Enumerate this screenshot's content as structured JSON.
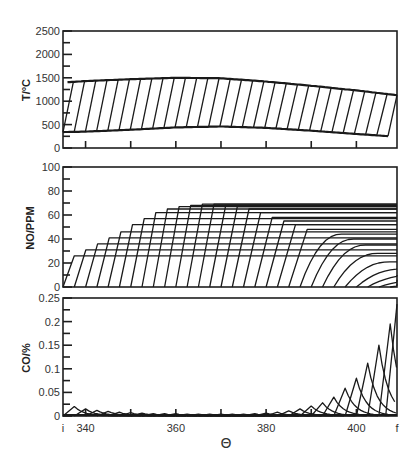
{
  "chart_data": [
    {
      "type": "area",
      "panel": "top",
      "ylabel": "T/°C",
      "ylim": [
        0,
        2500
      ],
      "yticks": [
        0,
        500,
        1000,
        1500,
        2000,
        2500
      ],
      "xlim": [
        335,
        409
      ],
      "grid": false,
      "description": "Hatched band between lower (unburned) and upper (burned) gas temperature; each hatch line is one mass element burning",
      "x": [
        335,
        340,
        350,
        360,
        370,
        380,
        390,
        400,
        409
      ],
      "series": [
        {
          "name": "burned gas temperature (upper)",
          "values": [
            1400,
            1430,
            1470,
            1500,
            1490,
            1420,
            1330,
            1230,
            1130
          ]
        },
        {
          "name": "unburned gas temperature (lower)",
          "values": [
            340,
            350,
            390,
            440,
            460,
            430,
            370,
            300,
            240
          ]
        }
      ],
      "hatch_count": 30
    },
    {
      "type": "line",
      "panel": "middle",
      "ylabel": "NO/PPM",
      "ylim": [
        0,
        100
      ],
      "yticks": [
        0,
        20,
        40,
        60,
        80,
        100
      ],
      "xlim": [
        335,
        409
      ],
      "grid": false,
      "description": "NO concentration histories of successively burned mass elements; each rises from 0 to a frozen plateau",
      "series_start_theta": [
        335.0,
        337.5,
        340.0,
        342.5,
        345.0,
        347.5,
        350.0,
        352.5,
        355.0,
        357.5,
        360.0,
        362.5,
        365.0,
        367.5,
        370.0,
        372.5,
        375.0,
        377.5,
        380.0,
        382.5,
        385.0,
        387.5,
        390.0,
        392.5,
        395.0,
        397.5,
        400.0,
        402.5,
        405.0,
        407.5
      ],
      "series_plateau_ppm": [
        26,
        31,
        36,
        41,
        46,
        52,
        57,
        62,
        65,
        67,
        68,
        69,
        69,
        68,
        67,
        65,
        62,
        58,
        55,
        52,
        48,
        44,
        40,
        35,
        28,
        21,
        15,
        10,
        6,
        3
      ]
    },
    {
      "type": "line",
      "panel": "bottom",
      "ylabel": "CO/%",
      "ylim": [
        0,
        0.25
      ],
      "yticks": [
        0,
        0.05,
        0.1,
        0.15,
        0.2,
        0.25
      ],
      "xlabel": "Θ",
      "xlim": [
        335,
        409
      ],
      "xticks": [
        "i",
        "340",
        "360",
        "380",
        "400",
        "f"
      ],
      "grid": false,
      "description": "CO concentration histories of successively burned mass elements; each peaks then decays",
      "series_peak_theta": [
        337.5,
        340.0,
        342.5,
        345.0,
        347.5,
        350.0,
        352.5,
        355.0,
        357.5,
        360.0,
        362.5,
        365.0,
        367.5,
        370.0,
        372.5,
        375.0,
        377.5,
        380.0,
        382.5,
        385.0,
        387.5,
        390.0,
        392.5,
        395.0,
        397.5,
        400.0,
        402.5,
        405.0,
        407.5,
        409.0
      ],
      "series_peak_value": [
        0.02,
        0.015,
        0.012,
        0.01,
        0.008,
        0.007,
        0.006,
        0.005,
        0.005,
        0.005,
        0.004,
        0.004,
        0.004,
        0.004,
        0.004,
        0.004,
        0.005,
        0.006,
        0.008,
        0.011,
        0.015,
        0.021,
        0.028,
        0.04,
        0.059,
        0.08,
        0.112,
        0.15,
        0.195,
        0.237
      ]
    }
  ],
  "panels": {
    "top": {
      "ylabel": "T/°C",
      "ytick_labels": [
        "2500",
        "2000",
        "1500",
        "1000",
        "500",
        "0"
      ]
    },
    "middle": {
      "ylabel": "NO/PPM",
      "ytick_labels": [
        "100",
        "80",
        "60",
        "40",
        "20",
        "0"
      ]
    },
    "bottom": {
      "ylabel": "CO/%",
      "ytick_labels": [
        "0.25",
        "0.2",
        "0.15",
        "0.1",
        "0.05",
        "0"
      ]
    }
  },
  "xaxis": {
    "title": "Θ",
    "labels": [
      {
        "text": "i",
        "theta": 335
      },
      {
        "text": "340",
        "theta": 340
      },
      {
        "text": "360",
        "theta": 360
      },
      {
        "text": "380",
        "theta": 380
      },
      {
        "text": "400",
        "theta": 400
      },
      {
        "text": "f",
        "theta": 409
      }
    ],
    "minor_ticks": [
      340,
      350,
      360,
      370,
      380,
      390,
      400
    ]
  }
}
